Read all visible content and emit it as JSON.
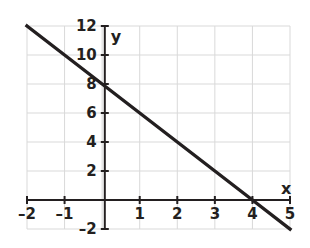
{
  "chart_data": {
    "type": "line",
    "title": "",
    "xlabel": "x",
    "ylabel": "y",
    "xlim": [
      -2,
      5
    ],
    "ylim": [
      -2,
      12
    ],
    "grid": true,
    "grid_color": "#d9d9d9",
    "axis_color": "#231f20",
    "line_color": "#231f20",
    "background": "#ffffff",
    "legend": null,
    "equation": "y = -2x + 8",
    "slope": -2,
    "y_intercept": 8,
    "x_intercept": 4,
    "series": [
      {
        "name": "y = -2x + 8",
        "x": [
          -2,
          -1,
          0,
          1,
          2,
          3,
          4,
          5
        ],
        "y": [
          12,
          10,
          8,
          6,
          4,
          2,
          0,
          -2
        ]
      }
    ],
    "x_ticks": [
      {
        "value": -2,
        "label": "–2"
      },
      {
        "value": -1,
        "label": "–1"
      },
      {
        "value": 0,
        "label": ""
      },
      {
        "value": 1,
        "label": "1"
      },
      {
        "value": 2,
        "label": "2"
      },
      {
        "value": 3,
        "label": "3"
      },
      {
        "value": 4,
        "label": "4"
      },
      {
        "value": 5,
        "label": "5"
      }
    ],
    "y_ticks": [
      {
        "value": 12,
        "label": "12"
      },
      {
        "value": 10,
        "label": "10"
      },
      {
        "value": 8,
        "label": "8"
      },
      {
        "value": 6,
        "label": "6"
      },
      {
        "value": 4,
        "label": "4"
      },
      {
        "value": 2,
        "label": "2"
      },
      {
        "value": 0,
        "label": ""
      },
      {
        "value": -2,
        "label": "–2"
      }
    ],
    "x_tick_step": 1,
    "y_tick_step": 2
  },
  "geometry": {
    "px_x_min": 27,
    "px_x_max": 290,
    "px_y_top": 26,
    "px_y_bottom": 229,
    "axis_x_px": 104.8,
    "axis_y_px": 200.0
  },
  "labels": {
    "x_axis_name": "x",
    "y_axis_name": "y"
  }
}
